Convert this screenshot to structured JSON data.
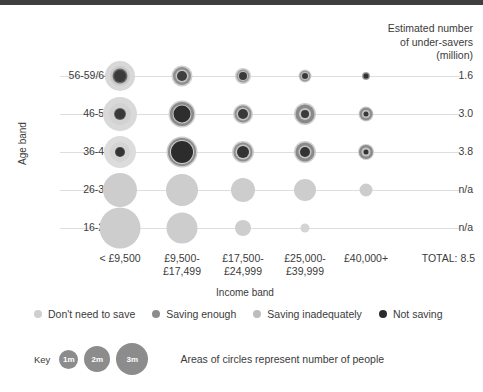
{
  "header": {
    "line1": "Estimated number",
    "line2": "of under-savers",
    "line3": "(million)"
  },
  "axes": {
    "y_title": "Age band",
    "x_title": "Income band"
  },
  "total_label": "TOTAL: 8.5",
  "categories": [
    {
      "name": "dont-need-to-save",
      "label": "Don't need to save",
      "color": "#cfcfcf"
    },
    {
      "name": "saving-enough",
      "label": "Saving enough",
      "color": "#8c8c8c"
    },
    {
      "name": "saving-inadequately",
      "label": "Saving inadequately",
      "color": "#bdbdbd"
    },
    {
      "name": "not-saving",
      "label": "Not saving",
      "color": "#2b2b2b"
    }
  ],
  "key": {
    "word": "Key",
    "note": "Areas of circles represent number of people",
    "color": "#8c8c8c",
    "bubbles": [
      {
        "label": "1m",
        "diameter": 19
      },
      {
        "label": "2m",
        "diameter": 26
      },
      {
        "label": "3m",
        "diameter": 32
      }
    ]
  },
  "chart_data": {
    "type": "scatter",
    "title": "Estimated number of under-savers (million)",
    "xlabel": "Income band",
    "ylabel": "Age band",
    "legend_position": "bottom",
    "grid": true,
    "size_encoding": "Areas of circles represent number of people",
    "size_key": [
      {
        "label": "1m",
        "value": 1
      },
      {
        "label": "2m",
        "value": 2
      },
      {
        "label": "3m",
        "value": 3
      }
    ],
    "series_names": [
      "Don't need to save",
      "Saving enough",
      "Saving inadequately",
      "Not saving"
    ],
    "categories_x": [
      "< £9,500",
      "£9,500-£17,499",
      "£17,500-£24,999",
      "£25,000-£39,999",
      "£40,000+"
    ],
    "categories_y": [
      "56-59/64",
      "46-55",
      "36-45",
      "26-35",
      "16-25"
    ],
    "row_totals": [
      "1.6",
      "3.0",
      "3.8",
      "n/a",
      "n/a"
    ],
    "grand_total": "TOTAL: 8.5"
  },
  "columns": [
    {
      "name": "under-9500",
      "line1": "< £9,500",
      "line2": "",
      "cx": 120
    },
    {
      "name": "9500-17499",
      "line1": "£9,500-",
      "line2": "£17,499",
      "cx": 182
    },
    {
      "name": "17500-24999",
      "line1": "£17,500-",
      "line2": "£24,999",
      "cx": 243
    },
    {
      "name": "25000-39999",
      "line1": "£25,000-",
      "line2": "£39,999",
      "cx": 305
    },
    {
      "name": "40000plus",
      "line1": "£40,000+",
      "line2": "",
      "cx": 366
    }
  ],
  "rows": [
    {
      "name": "56-59/64",
      "label": "56-59/64",
      "value": "1.6",
      "cy": 76,
      "cells": [
        {
          "cx": 120,
          "rings": [
            {
              "d": 30,
              "c": "#d8d8d8"
            },
            {
              "d": 20,
              "c": "#c9c9c9"
            },
            {
              "d": 15,
              "c": "#6a6a6a"
            },
            {
              "d": 12,
              "c": "#3a3a3a"
            }
          ]
        },
        {
          "cx": 182,
          "rings": [
            {
              "d": 21,
              "c": "#cfcfcf"
            },
            {
              "d": 18,
              "c": "#8f8f8f"
            },
            {
              "d": 13,
              "c": "#c4c4c4"
            },
            {
              "d": 10,
              "c": "#3f3f3f"
            }
          ]
        },
        {
          "cx": 243,
          "rings": [
            {
              "d": 16,
              "c": "#cfcfcf"
            },
            {
              "d": 13,
              "c": "#9a9a9a"
            },
            {
              "d": 10,
              "c": "#c2c2c2"
            },
            {
              "d": 8,
              "c": "#3a3a3a"
            }
          ]
        },
        {
          "cx": 305,
          "rings": [
            {
              "d": 13,
              "c": "#cfcfcf"
            },
            {
              "d": 11,
              "c": "#9a9a9a"
            },
            {
              "d": 8,
              "c": "#c0c0c0"
            },
            {
              "d": 6,
              "c": "#3a3a3a"
            }
          ]
        },
        {
          "cx": 366,
          "rings": [
            {
              "d": 8,
              "c": "#bdbdbd"
            },
            {
              "d": 7,
              "c": "#8a8a8a"
            },
            {
              "d": 5,
              "c": "#333333"
            }
          ]
        }
      ]
    },
    {
      "name": "46-55",
      "label": "46-55",
      "value": "3.0",
      "cy": 114,
      "cells": [
        {
          "cx": 120,
          "rings": [
            {
              "d": 34,
              "c": "#d9d9d9"
            },
            {
              "d": 22,
              "c": "#d2d2d2"
            },
            {
              "d": 12,
              "c": "#5f5f5f"
            },
            {
              "d": 10,
              "c": "#3a3a3a"
            }
          ]
        },
        {
          "cx": 182,
          "rings": [
            {
              "d": 27,
              "c": "#cfcfcf"
            },
            {
              "d": 24,
              "c": "#8a8a8a"
            },
            {
              "d": 19,
              "c": "#c9c9c9"
            },
            {
              "d": 17,
              "c": "#2e2e2e"
            }
          ]
        },
        {
          "cx": 243,
          "rings": [
            {
              "d": 20,
              "c": "#cfcfcf"
            },
            {
              "d": 17,
              "c": "#909090"
            },
            {
              "d": 13,
              "c": "#c4c4c4"
            },
            {
              "d": 10,
              "c": "#3a3a3a"
            }
          ]
        },
        {
          "cx": 305,
          "rings": [
            {
              "d": 22,
              "c": "#cfcfcf"
            },
            {
              "d": 19,
              "c": "#8a8a8a"
            },
            {
              "d": 12,
              "c": "#c4c4c4"
            },
            {
              "d": 8,
              "c": "#3a3a3a"
            }
          ]
        },
        {
          "cx": 366,
          "rings": [
            {
              "d": 15,
              "c": "#cfcfcf"
            },
            {
              "d": 13,
              "c": "#8e8e8e"
            },
            {
              "d": 8,
              "c": "#c4c4c4"
            },
            {
              "d": 5,
              "c": "#3a3a3a"
            }
          ]
        }
      ]
    },
    {
      "name": "36-45",
      "label": "36-45",
      "value": "3.8",
      "cy": 152,
      "cells": [
        {
          "cx": 120,
          "rings": [
            {
              "d": 32,
              "c": "#dcdcdc"
            },
            {
              "d": 20,
              "c": "#d4d4d4"
            },
            {
              "d": 10,
              "c": "#4a4a4a"
            },
            {
              "d": 8,
              "c": "#333333"
            }
          ]
        },
        {
          "cx": 182,
          "rings": [
            {
              "d": 31,
              "c": "#cccccc"
            },
            {
              "d": 28,
              "c": "#8c8c8c"
            },
            {
              "d": 24,
              "c": "#cfcfcf"
            },
            {
              "d": 22,
              "c": "#2c2c2c"
            }
          ]
        },
        {
          "cx": 243,
          "rings": [
            {
              "d": 22,
              "c": "#cfcfcf"
            },
            {
              "d": 19,
              "c": "#8f8f8f"
            },
            {
              "d": 15,
              "c": "#c6c6c6"
            },
            {
              "d": 12,
              "c": "#333333"
            }
          ]
        },
        {
          "cx": 305,
          "rings": [
            {
              "d": 22,
              "c": "#cfcfcf"
            },
            {
              "d": 19,
              "c": "#8a8a8a"
            },
            {
              "d": 13,
              "c": "#c4c4c4"
            },
            {
              "d": 10,
              "c": "#333333"
            }
          ]
        },
        {
          "cx": 366,
          "rings": [
            {
              "d": 16,
              "c": "#cfcfcf"
            },
            {
              "d": 14,
              "c": "#8a8a8a"
            },
            {
              "d": 9,
              "c": "#c4c4c4"
            },
            {
              "d": 5,
              "c": "#333333"
            }
          ]
        }
      ]
    },
    {
      "name": "26-35",
      "label": "26-35",
      "value": "n/a",
      "cy": 190,
      "cells": [
        {
          "cx": 120,
          "rings": [
            {
              "d": 34,
              "c": "#cdcdcd"
            }
          ]
        },
        {
          "cx": 182,
          "rings": [
            {
              "d": 32,
              "c": "#cdcdcd"
            }
          ]
        },
        {
          "cx": 243,
          "rings": [
            {
              "d": 24,
              "c": "#cdcdcd"
            }
          ]
        },
        {
          "cx": 305,
          "rings": [
            {
              "d": 22,
              "c": "#cdcdcd"
            }
          ]
        },
        {
          "cx": 366,
          "rings": [
            {
              "d": 13,
              "c": "#cdcdcd"
            }
          ]
        }
      ]
    },
    {
      "name": "16-25",
      "label": "16-25",
      "value": "n/a",
      "cy": 228,
      "cells": [
        {
          "cx": 120,
          "rings": [
            {
              "d": 41,
              "c": "#cdcdcd"
            }
          ]
        },
        {
          "cx": 182,
          "rings": [
            {
              "d": 31,
              "c": "#cdcdcd"
            }
          ]
        },
        {
          "cx": 243,
          "rings": [
            {
              "d": 16,
              "c": "#cdcdcd"
            }
          ]
        },
        {
          "cx": 305,
          "rings": [
            {
              "d": 9,
              "c": "#d4d4d4"
            }
          ]
        },
        {
          "cx": 366,
          "rings": []
        }
      ]
    }
  ]
}
